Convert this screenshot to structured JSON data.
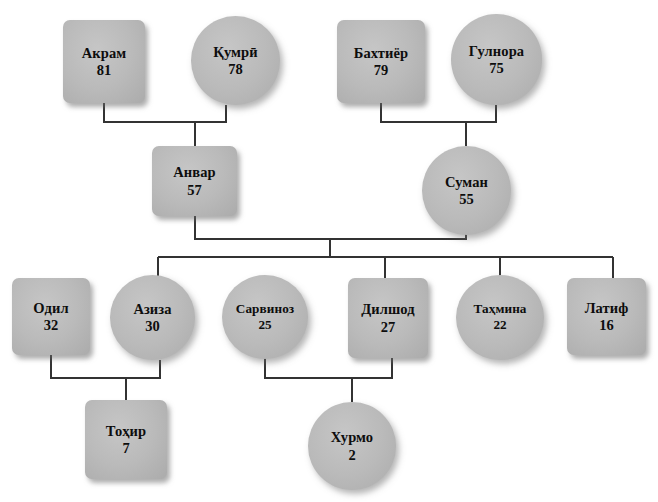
{
  "diagram": {
    "type": "genealogy-tree",
    "colors": {
      "node_fill": "#bababa",
      "node_stroke_shadow": "#6c6c6c",
      "edge": "#333333",
      "background": "#ffffff",
      "text": "#0d0d0d"
    },
    "legend": {
      "square_meaning": "male",
      "circle_meaning": "female"
    },
    "generations": [
      {
        "index": 1,
        "label": "grandparents",
        "members": [
          {
            "id": "akram",
            "name": "Акрам",
            "age": "81",
            "shape": "square"
          },
          {
            "id": "qumri",
            "name": "Қумрӣ",
            "age": "78",
            "shape": "circle"
          },
          {
            "id": "bakhtiyor",
            "name": "Бахтиёр",
            "age": "79",
            "shape": "square"
          },
          {
            "id": "gulnora",
            "name": "Гулнора",
            "age": "75",
            "shape": "circle"
          }
        ]
      },
      {
        "index": 2,
        "label": "parents",
        "members": [
          {
            "id": "anvar",
            "name": "Анвар",
            "age": "57",
            "shape": "square"
          },
          {
            "id": "suman",
            "name": "Суман",
            "age": "55",
            "shape": "circle"
          }
        ]
      },
      {
        "index": 3,
        "label": "children",
        "members": [
          {
            "id": "odil",
            "name": "Одил",
            "age": "32",
            "shape": "square"
          },
          {
            "id": "aziza",
            "name": "Азиза",
            "age": "30",
            "shape": "circle"
          },
          {
            "id": "sarvinoz",
            "name": "Сарвиноз",
            "age": "25",
            "shape": "circle"
          },
          {
            "id": "dilshod",
            "name": "Дилшод",
            "age": "27",
            "shape": "square"
          },
          {
            "id": "takhmina",
            "name": "Таҳмина",
            "age": "22",
            "shape": "circle"
          },
          {
            "id": "latif",
            "name": "Латиф",
            "age": "16",
            "shape": "square"
          }
        ]
      },
      {
        "index": 4,
        "label": "grandchildren",
        "members": [
          {
            "id": "tokhir",
            "name": "Тоҳир",
            "age": "7",
            "shape": "square"
          },
          {
            "id": "khurmo",
            "name": "Хурмо",
            "age": "2",
            "shape": "circle"
          }
        ]
      }
    ],
    "unions": [
      {
        "partners": [
          "akram",
          "qumri"
        ],
        "children": [
          "anvar"
        ]
      },
      {
        "partners": [
          "bakhtiyor",
          "gulnora"
        ],
        "children": [
          "suman"
        ]
      },
      {
        "partners": [
          "anvar",
          "suman"
        ],
        "children": [
          "aziza",
          "dilshod",
          "takhmina",
          "latif"
        ]
      },
      {
        "partners": [
          "odil",
          "aziza"
        ],
        "children": [
          "tokhir"
        ]
      },
      {
        "partners": [
          "sarvinoz",
          "dilshod"
        ],
        "children": [
          "khurmo"
        ]
      }
    ]
  }
}
